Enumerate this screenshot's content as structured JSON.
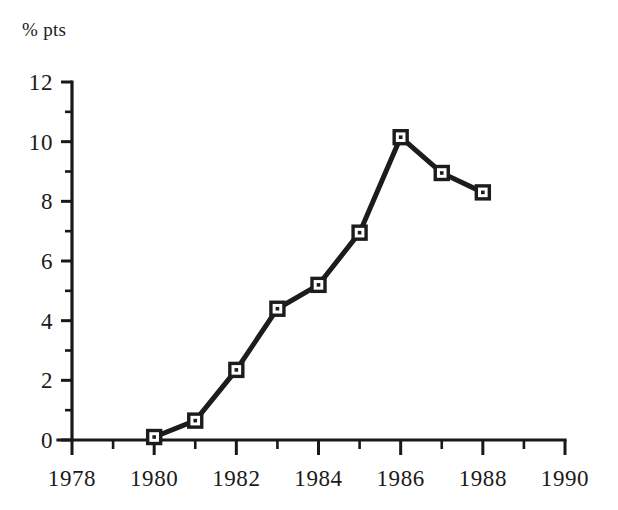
{
  "chart_data": {
    "type": "line",
    "title": "",
    "subtitle": "",
    "xlabel": "",
    "ylabel": "% pts",
    "unit_label": "% pts",
    "x": [
      1980,
      1981,
      1982,
      1983,
      1984,
      1985,
      1986,
      1987,
      1988
    ],
    "values": [
      0.1,
      0.65,
      2.35,
      4.4,
      5.2,
      6.95,
      10.15,
      8.95,
      8.3
    ],
    "series": [
      {
        "name": "% pts",
        "x": [
          1980,
          1981,
          1982,
          1983,
          1984,
          1985,
          1986,
          1987,
          1988
        ],
        "values": [
          0.1,
          0.65,
          2.35,
          4.4,
          5.2,
          6.95,
          10.15,
          8.95,
          8.3
        ]
      }
    ],
    "xlim": [
      1978,
      1990
    ],
    "ylim": [
      0,
      12
    ],
    "x_ticks": [
      1978,
      1980,
      1982,
      1984,
      1986,
      1988,
      1990
    ],
    "x_tick_labels": [
      "1978",
      "1980",
      "1982",
      "1984",
      "1986",
      "1988",
      "1990"
    ],
    "x_minor_ticks": [
      1979,
      1981,
      1983,
      1985,
      1987,
      1989
    ],
    "y_ticks": [
      0,
      2,
      4,
      6,
      8,
      10,
      12
    ],
    "y_tick_labels": [
      "0",
      "2",
      "4",
      "6",
      "8",
      "10",
      "12"
    ],
    "y_minor_ticks": [
      1,
      3,
      5,
      7,
      9,
      11
    ],
    "grid": false,
    "legend": false,
    "legend_position": "none",
    "marker": "square-with-center-dot",
    "colors": {
      "line": "#1c1c1c",
      "marker_fill": "#ffffff",
      "marker_edge": "#1c1c1c",
      "axis": "#181818",
      "text": "#1a1a1a",
      "background": "#ffffff"
    },
    "annotations": []
  },
  "axes_geometry": {
    "plot_left": 72,
    "plot_right": 565,
    "plot_top": 82,
    "plot_bottom": 440
  }
}
